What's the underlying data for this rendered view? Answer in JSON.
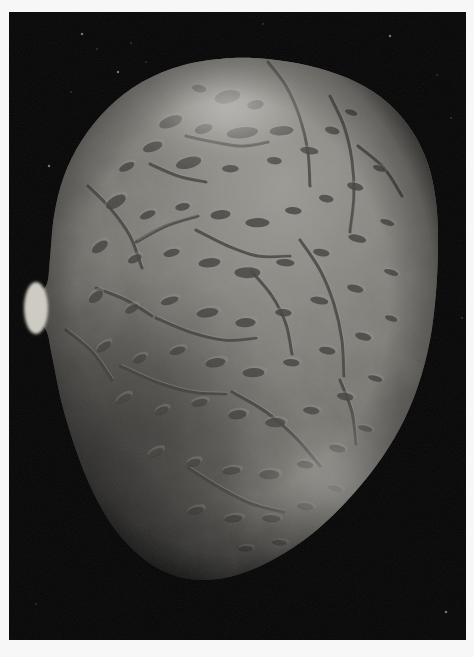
{
  "page": {
    "background_color": "#fdfdfd",
    "margin_color": "#f7f7f7",
    "caption": ""
  },
  "photo": {
    "name": "asteroid-surface-photograph",
    "space_background_color": "#060606",
    "frame": {
      "x": 9,
      "y": 12,
      "width": 457,
      "height": 628
    },
    "color_mode": "grayscale",
    "subject": "irregular cratered small body",
    "illumination": {
      "light_direction": "upper-right",
      "terminator_side": "lower-left",
      "specular_highlight_color": "#f2f0ec",
      "shadow_color": "#0a0a0a"
    },
    "palette": {
      "limb_bright": "#e8e6e0",
      "midtone": "#8e8b84",
      "base_regolith": "#6e6b65",
      "dark_regolith": "#34322f",
      "crater_shadow": "#131312",
      "groove_shadow": "#1a1a18",
      "space": "#050505"
    },
    "body_outline": [
      [
        232,
        58
      ],
      [
        276,
        60
      ],
      [
        318,
        68
      ],
      [
        356,
        82
      ],
      [
        388,
        103
      ],
      [
        412,
        131
      ],
      [
        428,
        164
      ],
      [
        436,
        202
      ],
      [
        438,
        244
      ],
      [
        436,
        292
      ],
      [
        430,
        340
      ],
      [
        418,
        386
      ],
      [
        400,
        428
      ],
      [
        376,
        466
      ],
      [
        346,
        502
      ],
      [
        312,
        534
      ],
      [
        276,
        558
      ],
      [
        240,
        574
      ],
      [
        204,
        580
      ],
      [
        170,
        574
      ],
      [
        140,
        556
      ],
      [
        114,
        528
      ],
      [
        93,
        492
      ],
      [
        76,
        450
      ],
      [
        62,
        404
      ],
      [
        52,
        356
      ],
      [
        46,
        330
      ],
      [
        31,
        312
      ],
      [
        30,
        296
      ],
      [
        46,
        286
      ],
      [
        50,
        258
      ],
      [
        54,
        216
      ],
      [
        64,
        176
      ],
      [
        82,
        140
      ],
      [
        108,
        108
      ],
      [
        142,
        82
      ],
      [
        184,
        65
      ]
    ],
    "features": {
      "bright_polar_highlight": {
        "cx": 228,
        "cy": 108,
        "rx": 78,
        "ry": 44
      },
      "bright_lower_limb": {
        "cx": 352,
        "cy": 496,
        "rx": 86,
        "ry": 62
      },
      "left_limb_notch": {
        "cx": 36,
        "cy": 308,
        "rx": 12,
        "ry": 26
      },
      "dark_terminator_region": {
        "cx": 118,
        "cy": 452,
        "rx": 110,
        "ry": 120
      }
    },
    "star_specks": [
      [
        82,
        34
      ],
      [
        97,
        49
      ],
      [
        131,
        43
      ],
      [
        118,
        72
      ],
      [
        146,
        62
      ],
      [
        71,
        92
      ],
      [
        390,
        36
      ],
      [
        437,
        75
      ],
      [
        451,
        118
      ],
      [
        49,
        166
      ],
      [
        462,
        318
      ],
      [
        36,
        604
      ],
      [
        446,
        612
      ],
      [
        263,
        24
      ]
    ],
    "craters": [
      [
        228,
        96,
        14,
        7,
        -12
      ],
      [
        256,
        104,
        9,
        5,
        -8
      ],
      [
        200,
        88,
        8,
        4,
        10
      ],
      [
        171,
        121,
        13,
        6,
        -20
      ],
      [
        204,
        128,
        10,
        5,
        -16
      ],
      [
        243,
        132,
        17,
        6,
        -6
      ],
      [
        282,
        130,
        13,
        5,
        -4
      ],
      [
        153,
        146,
        11,
        5,
        -18
      ],
      [
        127,
        166,
        9,
        4,
        -26
      ],
      [
        189,
        162,
        14,
        6,
        -14
      ],
      [
        231,
        168,
        9,
        4,
        0
      ],
      [
        275,
        160,
        8,
        4,
        6
      ],
      [
        310,
        150,
        10,
        4,
        8
      ],
      [
        333,
        130,
        8,
        4,
        14
      ],
      [
        352,
        112,
        7,
        3,
        18
      ],
      [
        116,
        201,
        12,
        6,
        -30
      ],
      [
        148,
        214,
        9,
        4,
        -22
      ],
      [
        183,
        206,
        8,
        4,
        -10
      ],
      [
        221,
        214,
        11,
        5,
        -6
      ],
      [
        258,
        222,
        13,
        5,
        0
      ],
      [
        294,
        210,
        9,
        4,
        4
      ],
      [
        327,
        198,
        8,
        4,
        10
      ],
      [
        356,
        186,
        9,
        4,
        14
      ],
      [
        380,
        168,
        7,
        3,
        20
      ],
      [
        100,
        246,
        10,
        5,
        -34
      ],
      [
        135,
        258,
        8,
        4,
        -26
      ],
      [
        172,
        252,
        9,
        4,
        -14
      ],
      [
        210,
        262,
        12,
        5,
        -6
      ],
      [
        248,
        272,
        14,
        6,
        0
      ],
      [
        286,
        262,
        10,
        4,
        4
      ],
      [
        322,
        252,
        9,
        4,
        10
      ],
      [
        358,
        238,
        10,
        4,
        14
      ],
      [
        388,
        222,
        8,
        3,
        18
      ],
      [
        96,
        296,
        9,
        5,
        -36
      ],
      [
        132,
        308,
        8,
        4,
        -28
      ],
      [
        170,
        300,
        10,
        4,
        -16
      ],
      [
        208,
        312,
        12,
        5,
        -8
      ],
      [
        246,
        322,
        11,
        5,
        -2
      ],
      [
        284,
        312,
        9,
        4,
        4
      ],
      [
        320,
        300,
        10,
        4,
        10
      ],
      [
        356,
        288,
        9,
        4,
        14
      ],
      [
        392,
        272,
        8,
        3,
        18
      ],
      [
        104,
        346,
        9,
        4,
        -34
      ],
      [
        140,
        358,
        8,
        4,
        -26
      ],
      [
        178,
        350,
        9,
        4,
        -16
      ],
      [
        216,
        362,
        11,
        5,
        -8
      ],
      [
        254,
        372,
        12,
        5,
        -2
      ],
      [
        292,
        362,
        9,
        4,
        4
      ],
      [
        328,
        350,
        9,
        4,
        10
      ],
      [
        364,
        336,
        9,
        4,
        14
      ],
      [
        392,
        318,
        7,
        3,
        18
      ],
      [
        124,
        398,
        9,
        4,
        -30
      ],
      [
        162,
        410,
        8,
        4,
        -22
      ],
      [
        200,
        402,
        9,
        4,
        -12
      ],
      [
        238,
        414,
        10,
        5,
        -6
      ],
      [
        276,
        422,
        11,
        5,
        0
      ],
      [
        312,
        410,
        9,
        4,
        6
      ],
      [
        346,
        396,
        9,
        4,
        10
      ],
      [
        376,
        378,
        8,
        3,
        16
      ],
      [
        156,
        452,
        9,
        4,
        -26
      ],
      [
        194,
        462,
        8,
        4,
        -16
      ],
      [
        232,
        470,
        10,
        4,
        -6
      ],
      [
        270,
        474,
        11,
        5,
        0
      ],
      [
        306,
        464,
        9,
        4,
        6
      ],
      [
        338,
        448,
        9,
        4,
        12
      ],
      [
        366,
        428,
        8,
        3,
        16
      ],
      [
        196,
        510,
        9,
        4,
        -14
      ],
      [
        234,
        518,
        10,
        4,
        -6
      ],
      [
        272,
        518,
        10,
        4,
        2
      ],
      [
        306,
        506,
        9,
        4,
        8
      ],
      [
        336,
        488,
        8,
        3,
        14
      ],
      [
        246,
        548,
        8,
        3,
        -2
      ],
      [
        280,
        542,
        8,
        3,
        4
      ]
    ],
    "grooves": [
      [
        [
          268,
          62
        ],
        [
          286,
          86
        ],
        [
          300,
          118
        ],
        [
          308,
          152
        ],
        [
          310,
          186
        ]
      ],
      [
        [
          186,
          136
        ],
        [
          214,
          142
        ],
        [
          242,
          146
        ],
        [
          268,
          142
        ]
      ],
      [
        [
          150,
          164
        ],
        [
          178,
          176
        ],
        [
          206,
          182
        ]
      ],
      [
        [
          330,
          96
        ],
        [
          344,
          126
        ],
        [
          352,
          160
        ],
        [
          354,
          196
        ],
        [
          350,
          232
        ]
      ],
      [
        [
          88,
          186
        ],
        [
          110,
          208
        ],
        [
          130,
          236
        ],
        [
          142,
          268
        ]
      ],
      [
        [
          196,
          230
        ],
        [
          228,
          246
        ],
        [
          258,
          256
        ],
        [
          290,
          256
        ]
      ],
      [
        [
          252,
          272
        ],
        [
          272,
          296
        ],
        [
          286,
          324
        ],
        [
          292,
          354
        ]
      ],
      [
        [
          156,
          318
        ],
        [
          190,
          332
        ],
        [
          224,
          340
        ],
        [
          256,
          338
        ]
      ],
      [
        [
          300,
          240
        ],
        [
          320,
          270
        ],
        [
          334,
          304
        ],
        [
          342,
          340
        ],
        [
          344,
          376
        ]
      ],
      [
        [
          120,
          366
        ],
        [
          156,
          382
        ],
        [
          192,
          392
        ],
        [
          226,
          394
        ]
      ],
      [
        [
          232,
          392
        ],
        [
          266,
          412
        ],
        [
          296,
          438
        ],
        [
          320,
          466
        ]
      ],
      [
        [
          96,
          288
        ],
        [
          126,
          300
        ],
        [
          152,
          316
        ]
      ],
      [
        [
          340,
          380
        ],
        [
          352,
          412
        ],
        [
          356,
          444
        ]
      ],
      [
        [
          188,
          468
        ],
        [
          220,
          488
        ],
        [
          252,
          504
        ],
        [
          284,
          512
        ]
      ],
      [
        [
          136,
          242
        ],
        [
          166,
          226
        ],
        [
          198,
          216
        ]
      ],
      [
        [
          358,
          146
        ],
        [
          384,
          168
        ],
        [
          402,
          196
        ]
      ],
      [
        [
          66,
          330
        ],
        [
          92,
          352
        ],
        [
          112,
          380
        ]
      ]
    ]
  }
}
